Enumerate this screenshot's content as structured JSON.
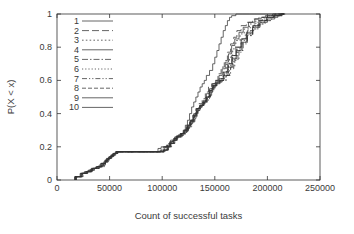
{
  "chart_data": {
    "type": "line",
    "title": "",
    "xlabel": "Count of successful tasks",
    "ylabel": "P(X < x)",
    "xlim": [
      0,
      250000
    ],
    "ylim": [
      0,
      1
    ],
    "xticks": [
      0,
      50000,
      100000,
      150000,
      200000,
      250000
    ],
    "xticklabels": [
      "0",
      "50000",
      "100000",
      "150000",
      "200000",
      "250000"
    ],
    "yticks": [
      0,
      0.2,
      0.4,
      0.6,
      0.8,
      1
    ],
    "yticklabels": [
      "0",
      "0.2",
      "0.4",
      "0.6",
      "0.8",
      "1"
    ],
    "grid": false,
    "legend_position": "upper-left-inside",
    "legend_entries": [
      "1",
      "2",
      "3",
      "4",
      "5",
      "6",
      "7",
      "8",
      "9",
      "10"
    ],
    "line_color": "#333333",
    "series": [
      {
        "name": "1",
        "dash": "none",
        "x": [
          17000,
          17000,
          22000,
          26000,
          30000,
          34000,
          38000,
          43000,
          46000,
          47000,
          50000,
          52000,
          54000,
          56000,
          58000,
          82000,
          96000,
          99000,
          103000,
          105000,
          108000,
          112000,
          115000,
          118000,
          120000,
          122000,
          124000,
          126000,
          128000,
          130000,
          132000,
          134000,
          136000,
          138000,
          140000,
          142000,
          145000,
          148000,
          150000,
          152000,
          154000,
          156000,
          158000,
          160000,
          162000,
          164000,
          166000,
          170000,
          176000,
          183000,
          188000,
          190000,
          196000,
          204000,
          212000,
          216000
        ],
        "y": [
          0,
          0.02,
          0.04,
          0.05,
          0.06,
          0.07,
          0.08,
          0.09,
          0.11,
          0.13,
          0.14,
          0.15,
          0.16,
          0.17,
          0.17,
          0.17,
          0.19,
          0.2,
          0.2,
          0.21,
          0.24,
          0.26,
          0.27,
          0.28,
          0.3,
          0.33,
          0.36,
          0.4,
          0.44,
          0.47,
          0.5,
          0.53,
          0.56,
          0.58,
          0.6,
          0.63,
          0.66,
          0.7,
          0.74,
          0.78,
          0.82,
          0.86,
          0.9,
          0.93,
          0.96,
          0.98,
          0.99,
          1,
          1,
          1,
          1,
          1,
          1,
          1,
          1,
          1
        ]
      },
      {
        "name": "2",
        "dash": "7,3",
        "x": [
          17000,
          17000,
          23000,
          27000,
          31000,
          35000,
          40000,
          44000,
          47000,
          49000,
          51000,
          53000,
          55000,
          57000,
          59000,
          98000,
          101000,
          104000,
          107000,
          110000,
          114000,
          117000,
          120000,
          123000,
          126000,
          129000,
          132000,
          135000,
          138000,
          141000,
          144000,
          147000,
          150000,
          153000,
          156000,
          159000,
          162000,
          165000,
          168000,
          171000,
          175000,
          180000,
          186000,
          192000,
          198000,
          205000,
          210000,
          215000
        ],
        "y": [
          0,
          0.02,
          0.04,
          0.05,
          0.06,
          0.07,
          0.08,
          0.1,
          0.12,
          0.14,
          0.15,
          0.16,
          0.17,
          0.17,
          0.17,
          0.18,
          0.2,
          0.21,
          0.23,
          0.25,
          0.27,
          0.28,
          0.29,
          0.32,
          0.35,
          0.39,
          0.43,
          0.46,
          0.49,
          0.53,
          0.56,
          0.58,
          0.6,
          0.64,
          0.68,
          0.72,
          0.77,
          0.82,
          0.86,
          0.9,
          0.93,
          0.95,
          0.97,
          0.98,
          0.99,
          1,
          1,
          1
        ]
      },
      {
        "name": "3",
        "dash": "1.6,2.2",
        "x": [
          17500,
          17500,
          23000,
          28000,
          32000,
          36000,
          41000,
          45000,
          48000,
          50000,
          52000,
          54000,
          56000,
          58000,
          60000,
          100000,
          103000,
          106000,
          109000,
          112000,
          116000,
          119000,
          122000,
          125000,
          128000,
          131000,
          134000,
          137000,
          140000,
          143000,
          146000,
          149000,
          152000,
          155000,
          158000,
          161000,
          164000,
          167000,
          170000,
          174000,
          178000,
          183000,
          189000,
          195000,
          201000,
          208000,
          213000,
          216000
        ],
        "y": [
          0,
          0.02,
          0.04,
          0.05,
          0.06,
          0.07,
          0.08,
          0.1,
          0.12,
          0.14,
          0.15,
          0.16,
          0.17,
          0.17,
          0.17,
          0.18,
          0.2,
          0.22,
          0.24,
          0.26,
          0.27,
          0.28,
          0.3,
          0.33,
          0.36,
          0.4,
          0.43,
          0.45,
          0.47,
          0.5,
          0.54,
          0.57,
          0.59,
          0.61,
          0.65,
          0.7,
          0.74,
          0.79,
          0.84,
          0.88,
          0.91,
          0.94,
          0.96,
          0.98,
          0.99,
          1,
          1,
          1
        ]
      },
      {
        "name": "4",
        "dash": "none",
        "x": [
          17000,
          17000,
          22500,
          27000,
          31500,
          35500,
          40000,
          44500,
          47500,
          49500,
          51500,
          53500,
          55500,
          57500,
          59500,
          99000,
          102000,
          105000,
          108000,
          111000,
          115000,
          118000,
          121000,
          124000,
          127000,
          130000,
          133000,
          136000,
          139000,
          142000,
          145000,
          148000,
          151000,
          154000,
          157000,
          160000,
          163000,
          166000,
          169000,
          173000,
          177000,
          182000,
          188000,
          194000,
          200000,
          207000,
          212000,
          216000
        ],
        "y": [
          0,
          0.02,
          0.04,
          0.05,
          0.06,
          0.07,
          0.09,
          0.11,
          0.13,
          0.14,
          0.15,
          0.16,
          0.17,
          0.17,
          0.17,
          0.18,
          0.2,
          0.21,
          0.23,
          0.25,
          0.27,
          0.28,
          0.29,
          0.32,
          0.35,
          0.38,
          0.42,
          0.45,
          0.48,
          0.52,
          0.55,
          0.58,
          0.6,
          0.63,
          0.67,
          0.71,
          0.76,
          0.81,
          0.85,
          0.89,
          0.92,
          0.95,
          0.97,
          0.98,
          0.99,
          1,
          1,
          1
        ]
      },
      {
        "name": "5",
        "dash": "6,2,1.5,2",
        "x": [
          18000,
          18000,
          24000,
          28500,
          33000,
          37000,
          42000,
          46000,
          49000,
          51000,
          53000,
          55000,
          57000,
          59000,
          61000,
          101000,
          104000,
          107000,
          110000,
          113000,
          117000,
          120000,
          123000,
          126000,
          129000,
          132000,
          135000,
          138000,
          141000,
          144000,
          147000,
          150000,
          153000,
          157000,
          161000,
          165000,
          169000,
          173000,
          177000,
          181000,
          186000,
          191000,
          197000,
          203000,
          209000,
          214000,
          217000
        ],
        "y": [
          0,
          0.02,
          0.04,
          0.05,
          0.06,
          0.08,
          0.09,
          0.11,
          0.13,
          0.14,
          0.15,
          0.16,
          0.17,
          0.17,
          0.17,
          0.18,
          0.2,
          0.22,
          0.24,
          0.26,
          0.27,
          0.28,
          0.31,
          0.34,
          0.37,
          0.41,
          0.44,
          0.46,
          0.48,
          0.51,
          0.55,
          0.57,
          0.59,
          0.6,
          0.63,
          0.68,
          0.73,
          0.78,
          0.83,
          0.87,
          0.91,
          0.94,
          0.96,
          0.98,
          0.99,
          1,
          1
        ]
      },
      {
        "name": "6",
        "dash": "1.2,2",
        "x": [
          18000,
          18000,
          24000,
          29000,
          33500,
          38000,
          42500,
          46500,
          49500,
          51500,
          53500,
          55500,
          57500,
          59500,
          61500,
          102000,
          105000,
          108000,
          111000,
          114000,
          118000,
          121000,
          124000,
          127000,
          130000,
          133000,
          136000,
          139000,
          142000,
          145000,
          148000,
          151000,
          155000,
          159000,
          163000,
          167000,
          171000,
          175000,
          179000,
          184000,
          189000,
          195000,
          201000,
          207000,
          212000,
          216000
        ],
        "y": [
          0,
          0.02,
          0.04,
          0.05,
          0.07,
          0.08,
          0.1,
          0.12,
          0.13,
          0.14,
          0.15,
          0.16,
          0.17,
          0.17,
          0.17,
          0.18,
          0.2,
          0.22,
          0.24,
          0.26,
          0.27,
          0.29,
          0.32,
          0.35,
          0.38,
          0.42,
          0.44,
          0.46,
          0.49,
          0.53,
          0.56,
          0.58,
          0.6,
          0.64,
          0.69,
          0.74,
          0.79,
          0.84,
          0.88,
          0.92,
          0.95,
          0.97,
          0.98,
          0.99,
          1,
          1
        ]
      },
      {
        "name": "7",
        "dash": "5,2,1.2,2,1.2,2",
        "x": [
          18500,
          18500,
          25000,
          29500,
          34000,
          38500,
          43000,
          47000,
          50000,
          52000,
          54000,
          56000,
          58000,
          60000,
          62000,
          103000,
          106000,
          109000,
          112000,
          115000,
          119000,
          122000,
          125000,
          128000,
          131000,
          134000,
          137000,
          140000,
          143000,
          146000,
          149000,
          152000,
          156000,
          160000,
          164000,
          168000,
          172000,
          176000,
          181000,
          186000,
          192000,
          198000,
          204000,
          210000,
          215000,
          217000
        ],
        "y": [
          0,
          0.02,
          0.04,
          0.06,
          0.07,
          0.08,
          0.1,
          0.12,
          0.13,
          0.14,
          0.15,
          0.16,
          0.17,
          0.17,
          0.17,
          0.18,
          0.2,
          0.22,
          0.25,
          0.26,
          0.27,
          0.29,
          0.32,
          0.35,
          0.39,
          0.43,
          0.45,
          0.47,
          0.5,
          0.54,
          0.57,
          0.59,
          0.6,
          0.63,
          0.67,
          0.72,
          0.77,
          0.82,
          0.87,
          0.91,
          0.94,
          0.96,
          0.98,
          0.99,
          1,
          1
        ]
      },
      {
        "name": "8",
        "dash": "4,2,4,2",
        "x": [
          18000,
          18000,
          24500,
          29000,
          33500,
          38000,
          42500,
          46500,
          49500,
          51500,
          53500,
          55500,
          57500,
          59500,
          61500,
          102000,
          105500,
          108500,
          111500,
          114500,
          118500,
          121500,
          124500,
          127500,
          130500,
          133500,
          136500,
          139500,
          142500,
          145500,
          148500,
          151500,
          155000,
          159000,
          163000,
          167000,
          171000,
          176000,
          181000,
          187000,
          193000,
          199000,
          206000,
          212000,
          216000
        ],
        "y": [
          0,
          0.02,
          0.04,
          0.05,
          0.07,
          0.08,
          0.1,
          0.12,
          0.13,
          0.14,
          0.15,
          0.16,
          0.17,
          0.17,
          0.17,
          0.18,
          0.2,
          0.22,
          0.24,
          0.26,
          0.28,
          0.3,
          0.33,
          0.36,
          0.4,
          0.43,
          0.45,
          0.47,
          0.5,
          0.54,
          0.57,
          0.59,
          0.61,
          0.65,
          0.7,
          0.75,
          0.8,
          0.85,
          0.9,
          0.93,
          0.96,
          0.98,
          0.99,
          1,
          1
        ]
      },
      {
        "name": "9",
        "dash": "none",
        "x": [
          17500,
          17500,
          23500,
          28000,
          32500,
          37000,
          41500,
          45500,
          48500,
          50500,
          52500,
          54500,
          56500,
          58500,
          60500,
          101000,
          104500,
          107500,
          110500,
          113500,
          117500,
          120500,
          123500,
          126500,
          129500,
          132500,
          135500,
          138500,
          141500,
          144500,
          147500,
          150500,
          154000,
          158000,
          162000,
          166000,
          170000,
          175000,
          180000,
          186000,
          192000,
          199000,
          206000,
          212000,
          216000
        ],
        "y": [
          0,
          0.02,
          0.04,
          0.05,
          0.07,
          0.08,
          0.1,
          0.12,
          0.13,
          0.14,
          0.15,
          0.16,
          0.17,
          0.17,
          0.17,
          0.18,
          0.2,
          0.22,
          0.24,
          0.26,
          0.28,
          0.3,
          0.33,
          0.36,
          0.39,
          0.43,
          0.45,
          0.47,
          0.5,
          0.54,
          0.57,
          0.59,
          0.61,
          0.65,
          0.7,
          0.75,
          0.8,
          0.85,
          0.89,
          0.93,
          0.96,
          0.98,
          0.99,
          1,
          1
        ]
      },
      {
        "name": "10",
        "dash": "none",
        "x": [
          18000,
          18000,
          24000,
          28500,
          33000,
          37500,
          42000,
          46000,
          49000,
          51000,
          53000,
          55000,
          57000,
          59000,
          61000,
          102000,
          105000,
          108000,
          111000,
          114000,
          118000,
          121000,
          124000,
          127000,
          130000,
          133000,
          136000,
          139000,
          142000,
          145000,
          148000,
          151000,
          154500,
          158500,
          162500,
          166500,
          170500,
          175000,
          180000,
          186000,
          193000,
          200000,
          207000,
          213000,
          217000
        ],
        "y": [
          0,
          0.02,
          0.04,
          0.05,
          0.07,
          0.08,
          0.1,
          0.12,
          0.13,
          0.14,
          0.15,
          0.16,
          0.17,
          0.17,
          0.17,
          0.18,
          0.2,
          0.22,
          0.24,
          0.26,
          0.28,
          0.3,
          0.33,
          0.36,
          0.4,
          0.43,
          0.45,
          0.47,
          0.5,
          0.53,
          0.56,
          0.58,
          0.6,
          0.63,
          0.68,
          0.73,
          0.78,
          0.83,
          0.88,
          0.92,
          0.95,
          0.97,
          0.99,
          1,
          1
        ]
      }
    ]
  }
}
